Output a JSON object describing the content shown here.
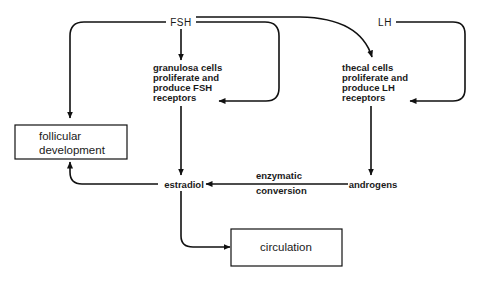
{
  "nodes": {
    "fsh": {
      "label": "FSH"
    },
    "lh": {
      "label": "LH"
    },
    "granulosa": {
      "lines": [
        "granulosa cells",
        "proliferate and",
        "produce FSH",
        "receptors"
      ]
    },
    "thecal": {
      "lines": [
        "thecal cells",
        "proliferate and",
        "produce LH",
        "receptors"
      ]
    },
    "follicular": {
      "lines": [
        "follicular",
        "development"
      ]
    },
    "estradiol": {
      "label": "estradiol"
    },
    "androgens": {
      "label": "androgens"
    },
    "circulation": {
      "label": "circulation"
    }
  },
  "edges": [
    {
      "from": "FSH",
      "to": "follicular development"
    },
    {
      "from": "FSH",
      "to": "granulosa cells proliferate and produce FSH receptors"
    },
    {
      "from": "FSH",
      "to": "granulosa cells proliferate and produce FSH receptors",
      "style": "loop"
    },
    {
      "from": "FSH",
      "to": "thecal cells proliferate and produce LH receptors"
    },
    {
      "from": "LH",
      "to": "thecal cells proliferate and produce LH receptors"
    },
    {
      "from": "granulosa cells",
      "to": "estradiol"
    },
    {
      "from": "thecal cells",
      "to": "androgens"
    },
    {
      "from": "androgens",
      "to": "estradiol",
      "label": [
        "enzymatic",
        "conversion"
      ]
    },
    {
      "from": "estradiol",
      "to": "follicular development"
    },
    {
      "from": "estradiol",
      "to": "circulation"
    }
  ],
  "edge_labels": {
    "conversion": [
      "enzymatic",
      "conversion"
    ]
  },
  "colors": {
    "line": "#111111",
    "background": "#ffffff",
    "text": "#1a1a1a"
  }
}
